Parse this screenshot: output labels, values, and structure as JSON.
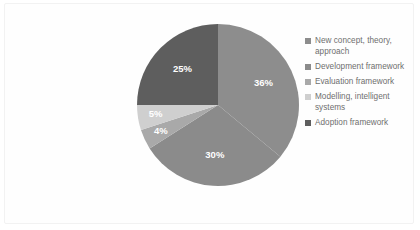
{
  "chart_data": {
    "type": "pie",
    "title": "",
    "categories": [
      "New concept, theory, approach",
      "Development framework",
      "Evaluation framework",
      "Modelling, intelligent systems",
      "Adoption framework"
    ],
    "values": [
      36,
      30,
      4,
      5,
      25
    ],
    "value_labels": [
      "36%",
      "30%",
      "4%",
      "5%",
      "25%"
    ],
    "unit": "%",
    "legend_position": "right",
    "grid": false,
    "colors": [
      "#8d8d8d",
      "#8b8b8b",
      "#a9a9a9",
      "#cfcfcf",
      "#5e5e5e"
    ],
    "start_angle_deg": 0,
    "direction": "clockwise",
    "slices": [
      {
        "label": "New concept, theory, approach",
        "value": 36,
        "display": "36%",
        "color": "#8d8d8d"
      },
      {
        "label": "Development framework",
        "value": 30,
        "display": "30%",
        "color": "#8b8b8b"
      },
      {
        "label": "Evaluation framework",
        "value": 4,
        "display": "4%",
        "color": "#a9a9a9"
      },
      {
        "label": "Modelling, intelligent systems",
        "value": 5,
        "display": "5%",
        "color": "#cfcfcf"
      },
      {
        "label": "Adoption framework",
        "value": 25,
        "display": "25%",
        "color": "#5e5e5e"
      }
    ]
  },
  "legend": {
    "items": [
      {
        "label": "New concept, theory,\napproach",
        "color": "#8d8d8d"
      },
      {
        "label": "Development framework",
        "color": "#8b8b8b"
      },
      {
        "label": "Evaluation framework",
        "color": "#a9a9a9"
      },
      {
        "label": "Modelling, intelligent\nsystems",
        "color": "#cfcfcf"
      },
      {
        "label": "Adoption framework",
        "color": "#5e5e5e"
      }
    ]
  },
  "card": {
    "background": "#fefefe",
    "border_color": "#f2f2f2"
  }
}
